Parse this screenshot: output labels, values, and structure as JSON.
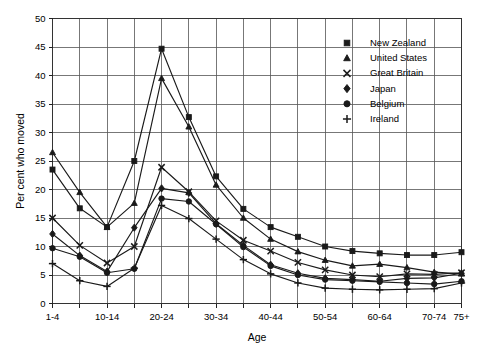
{
  "chart_data": {
    "type": "line",
    "title": "",
    "xlabel": "Age",
    "ylabel": "Per cent who moved",
    "ylim": [
      0,
      50
    ],
    "yticks": [
      0,
      5,
      10,
      15,
      20,
      25,
      30,
      35,
      40,
      45,
      50
    ],
    "ytick_labels": [
      "0",
      "5",
      "10",
      "15",
      "20",
      "25",
      "30",
      "35",
      "40",
      "45",
      "50"
    ],
    "grid": true,
    "legend_position": "top-right",
    "categories": [
      "1-4",
      "5-9",
      "10-14",
      "15-19",
      "20-24",
      "25-29",
      "30-34",
      "35-39",
      "40-44",
      "45-49",
      "50-54",
      "55-59",
      "60-64",
      "65-69",
      "70-74",
      "75+"
    ],
    "xtick_labels_shown": [
      "1-4",
      "10-14",
      "20-24",
      "30-34",
      "40-44",
      "50-54",
      "60-64",
      "70-74",
      "75+"
    ],
    "series": [
      {
        "name": "New Zealand",
        "marker": "square",
        "values": [
          23.5,
          16.7,
          13.4,
          25.0,
          44.7,
          32.7,
          22.3,
          16.6,
          13.4,
          11.7,
          10.0,
          9.2,
          8.8,
          8.5,
          8.5,
          9.0
        ]
      },
      {
        "name": "United States",
        "marker": "triangle",
        "values": [
          26.5,
          19.5,
          13.4,
          17.6,
          39.5,
          31.0,
          20.8,
          15.0,
          11.3,
          9.1,
          7.6,
          6.6,
          6.9,
          6.3,
          5.5,
          5.2
        ]
      },
      {
        "name": "Great Britain",
        "marker": "x",
        "values": [
          15.0,
          10.2,
          7.1,
          10.0,
          23.9,
          19.6,
          14.5,
          11.1,
          9.2,
          7.2,
          5.9,
          5.0,
          4.7,
          5.2,
          5.1,
          5.4
        ]
      },
      {
        "name": "Japan",
        "marker": "diamond",
        "values": [
          12.2,
          8.4,
          5.6,
          13.3,
          20.2,
          19.4,
          14.0,
          10.2,
          6.8,
          5.3,
          4.4,
          4.2,
          3.9,
          4.4,
          4.5,
          5.3
        ]
      },
      {
        "name": "Belgium",
        "marker": "circle",
        "values": [
          9.7,
          8.2,
          5.4,
          6.1,
          18.4,
          17.9,
          13.9,
          9.9,
          6.6,
          5.0,
          4.2,
          4.0,
          3.8,
          3.6,
          3.4,
          3.9
        ]
      },
      {
        "name": "Ireland",
        "marker": "plus",
        "values": [
          7.0,
          4.0,
          3.0,
          6.2,
          17.2,
          14.9,
          11.3,
          7.7,
          5.2,
          3.6,
          2.7,
          2.5,
          2.4,
          2.5,
          2.6,
          3.6
        ]
      }
    ]
  },
  "legend": {
    "items": [
      {
        "label": "New Zealand",
        "marker": "square"
      },
      {
        "label": "United States",
        "marker": "triangle"
      },
      {
        "label": "Great Britain",
        "marker": "x"
      },
      {
        "label": "Japan",
        "marker": "diamond"
      },
      {
        "label": "Belgium",
        "marker": "circle"
      },
      {
        "label": "Ireland",
        "marker": "plus"
      }
    ]
  },
  "axes": {
    "y_title": "Per cent who moved",
    "x_title": "Age"
  },
  "colors": {
    "ink": "#1a1a1a",
    "grid": "#555555",
    "frame": "#333333",
    "background": "#ffffff"
  }
}
